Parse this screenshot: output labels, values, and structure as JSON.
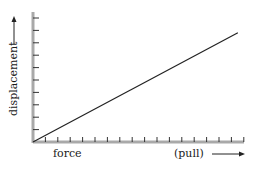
{
  "chart_data": {
    "type": "line",
    "title": "",
    "xlabel": "force",
    "xlabel_suffix": "(pull)",
    "ylabel": "displacement",
    "x_ticks": 17,
    "y_ticks": 10,
    "grid": false,
    "legend": null,
    "series": [
      {
        "name": "displacement vs force",
        "x": [
          0,
          1
        ],
        "y": [
          0,
          0.84
        ],
        "style": "straight line through origin"
      }
    ],
    "xlim": [
      0,
      1.03
    ],
    "ylim": [
      0,
      1
    ],
    "colors": {
      "axis": "#a9a9a9",
      "line": "#222222",
      "tick": "#333333",
      "text": "#1a1a1a"
    }
  },
  "labels": {
    "x_left": "force",
    "x_right": "(pull)",
    "y": "displacement"
  }
}
